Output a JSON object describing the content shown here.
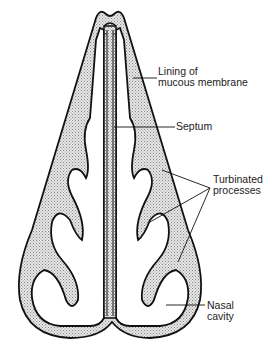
{
  "diagram": {
    "labels": {
      "lining": [
        "Lining of",
        "mucous membrane"
      ],
      "septum": "Septum",
      "turbinated": [
        "Turbinated",
        "processes"
      ],
      "nasal_cavity": [
        "Nasal",
        "cavity"
      ]
    },
    "colors": {
      "stroke": "#111111",
      "stipple": "#c8c8c8",
      "background": "#ffffff"
    }
  }
}
